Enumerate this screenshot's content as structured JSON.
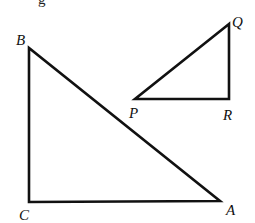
{
  "diagram": {
    "type": "geometry",
    "colors": {
      "stroke": "#111111",
      "background": "#ffffff"
    },
    "top_fragment": "g",
    "triangles": [
      {
        "name": "ABC",
        "right_angle_at": "C",
        "vertices": [
          {
            "label": "B",
            "x": 29,
            "y": 48,
            "label_x": 16,
            "label_y": 45
          },
          {
            "label": "C",
            "x": 29,
            "y": 202,
            "label_x": 19,
            "label_y": 220
          },
          {
            "label": "A",
            "x": 220,
            "y": 201,
            "label_x": 226,
            "label_y": 215
          }
        ]
      },
      {
        "name": "PQR",
        "right_angle_at": "R",
        "vertices": [
          {
            "label": "Q",
            "x": 229,
            "y": 24,
            "label_x": 232,
            "label_y": 27
          },
          {
            "label": "P",
            "x": 135,
            "y": 99,
            "label_x": 129,
            "label_y": 118
          },
          {
            "label": "R",
            "x": 229,
            "y": 99,
            "label_x": 223,
            "label_y": 120
          }
        ]
      }
    ]
  }
}
